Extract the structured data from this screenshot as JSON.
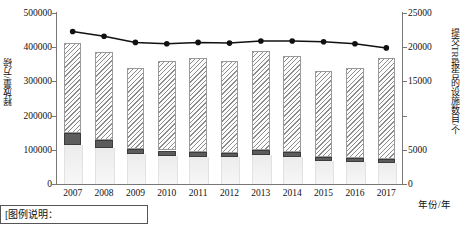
{
  "chart_data": {
    "type": "bar",
    "title": "",
    "subtitle": "",
    "xlabel": "年份/年",
    "ylabel": "释放量/万磅",
    "ylabel_right": "提交TRI报告的设施数目/个",
    "grid": false,
    "legend_position": "none",
    "categories": [
      "2007",
      "2008",
      "2009",
      "2010",
      "2011",
      "2012",
      "2013",
      "2014",
      "2015",
      "2016",
      "2017"
    ],
    "ylim": [
      0,
      500000
    ],
    "yticks": [
      0,
      100000,
      200000,
      300000,
      400000,
      500000
    ],
    "ytick_labels": [
      "0",
      "100000",
      "200000",
      "300000",
      "400000",
      "500000"
    ],
    "ylim_right": [
      0,
      25000
    ],
    "yticks_right": [
      0,
      5000,
      15000,
      20000,
      25000
    ],
    "ytick_labels_right": [
      "0",
      "5000",
      "15000",
      "20000",
      "25000"
    ],
    "stacked": true,
    "series": [
      {
        "name": "底部浅灰段",
        "style": "light-gray-fill",
        "axis": "left",
        "values": [
          115000,
          105000,
          88000,
          82000,
          80000,
          78000,
          85000,
          80000,
          66000,
          63000,
          60000
        ]
      },
      {
        "name": "中部深灰段",
        "style": "dark-gray-fill",
        "axis": "left",
        "values": [
          35000,
          23000,
          15000,
          16000,
          15000,
          14000,
          15000,
          15000,
          12000,
          12000,
          12000
        ]
      },
      {
        "name": "顶部斜线填充段",
        "style": "diagonal-hatch",
        "axis": "left",
        "values": [
          262000,
          257000,
          237000,
          262000,
          273000,
          268000,
          290000,
          280000,
          252000,
          263000,
          296000
        ]
      }
    ],
    "line_series": {
      "name": "提交TRI报告的设施数目",
      "style": "black-line-with-round-markers",
      "axis": "right",
      "values": [
        22300,
        21600,
        20700,
        20500,
        20700,
        20600,
        20900,
        20900,
        20800,
        20500,
        19900
      ]
    }
  },
  "caption": {
    "text": "[图例说明："
  }
}
